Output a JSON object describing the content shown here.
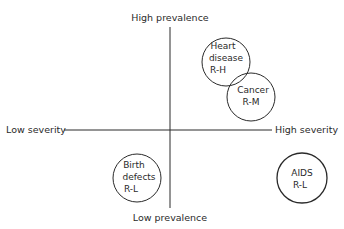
{
  "axes": {
    "top_label": "High prevalence",
    "bottom_label": "Low prevalence",
    "left_label": "Low severity",
    "right_label": "High severity"
  },
  "items": [
    {
      "name": "heart-disease",
      "lines": [
        "Heart",
        "disease",
        "R-H"
      ],
      "quadrant": "high-severity-high-prevalence"
    },
    {
      "name": "cancer",
      "lines": [
        "Cancer",
        "R-M"
      ],
      "quadrant": "high-severity-high-prevalence"
    },
    {
      "name": "birth-defects",
      "lines": [
        "Birth",
        "defects",
        "R-L"
      ],
      "quadrant": "low-severity-low-prevalence"
    },
    {
      "name": "aids",
      "lines": [
        "AIDS",
        "R-L"
      ],
      "quadrant": "high-severity-low-prevalence"
    }
  ],
  "colors": {
    "line": "#2a2a2a",
    "background": "#ffffff"
  }
}
